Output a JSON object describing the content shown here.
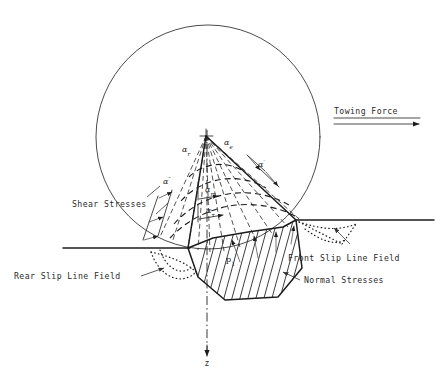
{
  "figure": {
    "background_color": "#ffffff",
    "line_color": "#1c1c1c",
    "text_color": "#2b2b2b",
    "width": 448,
    "height": 385
  },
  "callouts": {
    "towing_force": "Towing Force",
    "shear_stresses": "Shear Stresses",
    "rear_slip_line_field": "Rear Slip Line Field",
    "front_slip_line_field": "Front Slip Line Field",
    "normal_stresses": "Normal Stresses"
  },
  "angle_labels": [
    {
      "name": "alpha-r",
      "symbol": "α",
      "subscript": "r",
      "x": 182,
      "y": 152
    },
    {
      "name": "alpha-e",
      "symbol": "α",
      "subscript": "e",
      "x": 224,
      "y": 145
    },
    {
      "name": "alpha-prime",
      "symbol": "α",
      "subscript": "′",
      "x": 258,
      "y": 167
    },
    {
      "name": "alpha-dprime",
      "symbol": "α",
      "subscript": "″",
      "x": 163,
      "y": 184
    },
    {
      "name": "alpha-m",
      "symbol": "α",
      "subscript": "m",
      "x": 205,
      "y": 192
    },
    {
      "name": "alpha-tau",
      "symbol": "α",
      "subscript": "τ",
      "x": 206,
      "y": 213
    }
  ],
  "pressure_label": {
    "name": "p-1",
    "symbol": "p",
    "subscript": "1",
    "x": 226,
    "y": 262
  },
  "axis": {
    "vertical_label": "z",
    "vertical_label_x": 207,
    "vertical_label_y": 366
  },
  "geometry": {
    "wheel_circle": {
      "cx": 208,
      "cy": 137,
      "r": 112
    },
    "apex": {
      "x": 206,
      "y": 136
    },
    "ground_left": {
      "x1": 63,
      "y1": 248,
      "x2": 190,
      "y2": 248
    },
    "ground_right": {
      "x1": 296,
      "y1": 220,
      "x2": 434,
      "y2": 220
    },
    "towing_arrow": {
      "x1": 334,
      "y1": 124,
      "x2": 425,
      "y2": 124
    },
    "towing_underline": {
      "x1": 334,
      "y1": 118,
      "x2": 420,
      "y2": 118
    }
  }
}
